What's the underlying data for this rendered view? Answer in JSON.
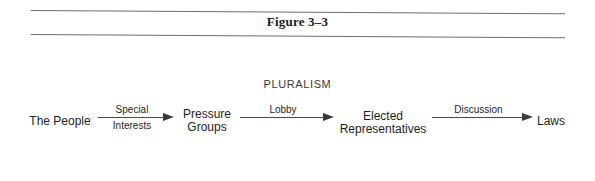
{
  "figure": {
    "title": "Figure 3–3"
  },
  "diagram": {
    "heading": "PLURALISM",
    "nodes": [
      {
        "id": "people",
        "lines": [
          "The People"
        ]
      },
      {
        "id": "pressure-groups",
        "lines": [
          "Pressure",
          "Groups"
        ]
      },
      {
        "id": "elected-representatives",
        "lines": [
          "Elected",
          "Representatives"
        ]
      },
      {
        "id": "laws",
        "lines": [
          "Laws"
        ]
      }
    ],
    "edges": [
      {
        "from": "people",
        "to": "pressure-groups",
        "label_top": "Special",
        "label_bottom": "Interests"
      },
      {
        "from": "pressure-groups",
        "to": "elected-representatives",
        "label_top": "Lobby",
        "label_bottom": ""
      },
      {
        "from": "elected-representatives",
        "to": "laws",
        "label_top": "Discussion",
        "label_bottom": ""
      }
    ]
  },
  "colors": {
    "rule": "#6e6e6e",
    "arrow": "#3a3a3a",
    "text": "#1e1e1e"
  }
}
